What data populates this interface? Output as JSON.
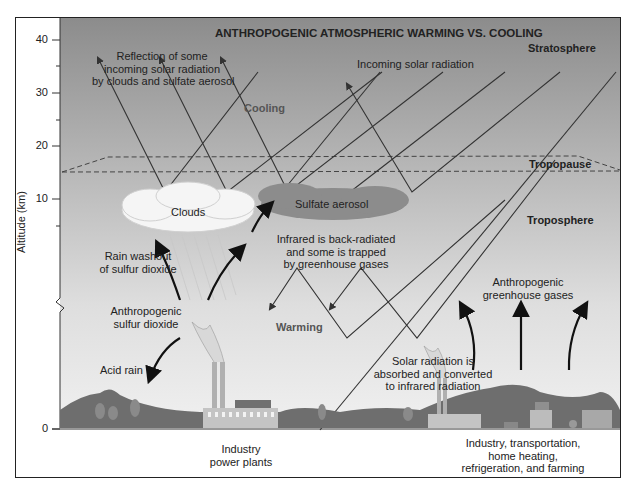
{
  "title": "ANTHROPOGENIC ATMOSPHERIC WARMING VS. COOLING",
  "axis": {
    "ylabel": "Altitude (km)",
    "ticks": [
      "40",
      "30",
      "20",
      "10",
      "0"
    ]
  },
  "layers": {
    "stratosphere": "Stratosphere",
    "tropopause": "Tropopause",
    "troposphere": "Troposphere"
  },
  "labels": {
    "reflection": [
      "Reflection of some",
      "incoming solar radiation",
      "by clouds and sulfate aerosol"
    ],
    "incoming": "Incoming solar radiation",
    "cooling": "Cooling",
    "warming": "Warming",
    "clouds": "Clouds",
    "sulfate_aerosol": "Sulfate aerosol",
    "infrared": [
      "Infrared is back-radiated",
      "and some is trapped",
      "by greenhouse gases"
    ],
    "rain_washout": [
      "Rain washout",
      "of sulfur dioxide"
    ],
    "anthro_so2": [
      "Anthropogenic",
      "sulfur dioxide"
    ],
    "acid_rain": "Acid rain",
    "solar_absorbed": [
      "Solar radiation is",
      "absorbed and converted",
      "to infrared radiation"
    ],
    "anthro_ghg": [
      "Anthropogenic",
      "greenhouse gases"
    ]
  },
  "sources": {
    "left": [
      "Industry",
      "power plants"
    ],
    "right": [
      "Industry, transportation,",
      "home heating,",
      "refrigeration, and farming"
    ]
  },
  "colors": {
    "sky_top": "#8f8f8f",
    "sky_bottom": "#ececec",
    "ground": "#6f6f6f",
    "aerosol": "#8a8a8a",
    "cloud": "#f4f4f4"
  }
}
